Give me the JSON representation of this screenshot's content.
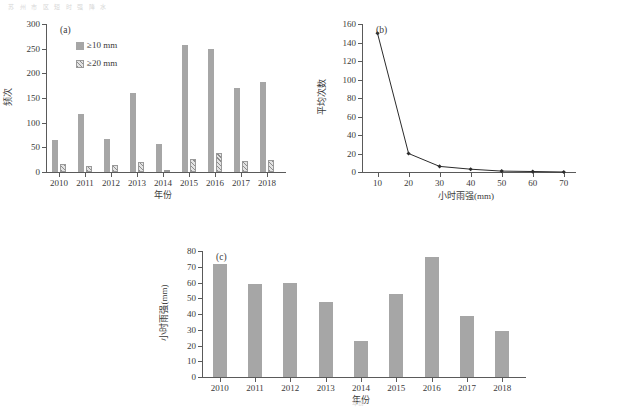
{
  "figure": {
    "top_artifact": "苏 州 市 区 短 时 强 降 水",
    "bottom_artifact": "年份"
  },
  "chart_data": [
    {
      "id": "a",
      "panel_tag": "(a)",
      "type": "bar",
      "title": "",
      "xlabel": "年份",
      "ylabel": "频次",
      "categories": [
        "2010",
        "2011",
        "2012",
        "2013",
        "2014",
        "2015",
        "2016",
        "2017",
        "2018"
      ],
      "series": [
        {
          "name": "≥10 mm",
          "style": "solid",
          "values": [
            65,
            118,
            67,
            160,
            56,
            258,
            249,
            170,
            183
          ]
        },
        {
          "name": "≥20 mm",
          "style": "hatch",
          "values": [
            16,
            12,
            15,
            20,
            2,
            27,
            39,
            22,
            25
          ]
        }
      ],
      "ylim": [
        0,
        300
      ],
      "yticks": [
        0,
        50,
        100,
        150,
        200,
        250,
        300
      ],
      "grid": false,
      "legend_position": "upper-left"
    },
    {
      "id": "b",
      "panel_tag": "(b)",
      "type": "line",
      "title": "",
      "xlabel": "小时雨强(mm)",
      "ylabel": "平均次数",
      "x": [
        10,
        20,
        30,
        40,
        50,
        60,
        70
      ],
      "values": [
        150,
        20,
        6,
        3,
        1,
        0.5,
        0
      ],
      "xlim": [
        5,
        72
      ],
      "ylim": [
        0,
        160
      ],
      "yticks": [
        0,
        20,
        40,
        60,
        80,
        100,
        120,
        140,
        160
      ],
      "xticks": [
        10,
        20,
        30,
        40,
        50,
        60,
        70
      ],
      "grid": false,
      "marker": "diamond",
      "line_color": "#2b2b2b"
    },
    {
      "id": "c",
      "panel_tag": "(c)",
      "type": "bar",
      "title": "",
      "xlabel": "年份",
      "ylabel": "小时雨强(mm)",
      "categories": [
        "2010",
        "2011",
        "2012",
        "2013",
        "2014",
        "2015",
        "2016",
        "2017",
        "2018"
      ],
      "series": [
        {
          "name": "小时雨强",
          "style": "solid",
          "values": [
            72,
            59,
            60,
            47.5,
            23,
            53,
            76,
            39,
            29.5
          ]
        }
      ],
      "ylim": [
        0,
        80
      ],
      "yticks": [
        0,
        10,
        20,
        30,
        40,
        50,
        60,
        70,
        80
      ],
      "grid": false,
      "legend_position": "none"
    }
  ],
  "colors": {
    "bar_solid": "#a6a6a6",
    "bar_hatch_line": "#8d8d8d",
    "axis": "#5a5a5a",
    "line": "#2b2b2b",
    "text": "#3a3a3a"
  }
}
